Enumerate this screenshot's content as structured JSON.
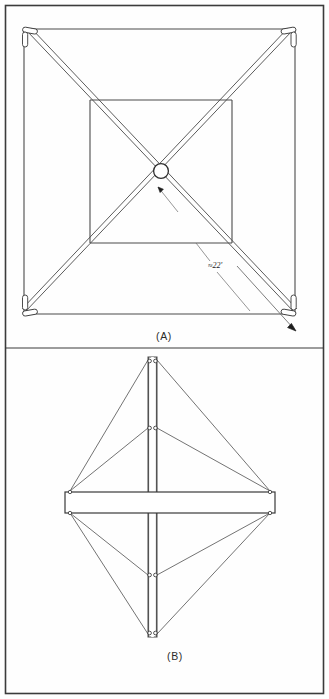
{
  "figure": {
    "border": {
      "color": "#3b3b3b",
      "x": 5,
      "y": 5,
      "width": 319,
      "height": 689
    },
    "line_color": "#4a4a4a",
    "member_color": "#3a3a3a",
    "fill_color": "#ffffff",
    "divider": {
      "y": 348,
      "color": "#3b3b3b"
    },
    "panels": [
      {
        "id": "A",
        "caption": "(A)",
        "view": "plan",
        "caption_pos": {
          "x": 164,
          "y": 338
        },
        "outer_square": {
          "x1": 22,
          "y1": 28,
          "x2": 297,
          "y2": 315
        },
        "inner_square": {
          "x1": 90,
          "y1": 100,
          "x2": 232,
          "y2": 243
        },
        "hub": {
          "cx": 161,
          "cy": 171,
          "r": 7.5
        },
        "corner_fittings": [
          {
            "cx": 26,
            "cy": 33,
            "angle": 45
          },
          {
            "cx": 293,
            "cy": 33,
            "angle": -45
          },
          {
            "cx": 26,
            "cy": 310,
            "angle": -45
          },
          {
            "cx": 293,
            "cy": 310,
            "angle": 45
          }
        ],
        "dimension": {
          "label": "≈22'",
          "label_pos": {
            "x": 213,
            "y": 267
          },
          "leader_from": {
            "x": 211,
            "y": 262
          },
          "leader_to": {
            "x": 196,
            "y": 243
          },
          "leader2_from": {
            "x": 216,
            "y": 272
          },
          "leader2_to": {
            "x": 246,
            "y": 307
          }
        },
        "arrow_head": {
          "x": 296,
          "y": 330,
          "from_x": 240,
          "from_y": 268
        },
        "inner_arrow_head": {
          "x": 156,
          "y": 186,
          "from_x": 176,
          "from_y": 210
        }
      },
      {
        "id": "B",
        "caption": "(B)",
        "view": "elevation",
        "caption_pos": {
          "x": 175,
          "y": 657
        },
        "mast": {
          "x1": 148,
          "x2": 157,
          "y_top": 357,
          "y_bottom": 637
        },
        "beam": {
          "x1": 65,
          "y1": 492,
          "x2": 275,
          "y2": 512
        },
        "nodes": [
          {
            "name": "mast-top",
            "x": 152,
            "y": 360
          },
          {
            "name": "mast-upper-mid",
            "x": 152,
            "y": 428
          },
          {
            "name": "mast-lower-mid",
            "x": 152,
            "y": 575
          },
          {
            "name": "mast-bottom",
            "x": 152,
            "y": 634
          },
          {
            "name": "beam-left-top",
            "x": 70,
            "y": 492
          },
          {
            "name": "beam-right-top",
            "x": 270,
            "y": 492
          },
          {
            "name": "beam-left-bottom",
            "x": 70,
            "y": 512
          },
          {
            "name": "beam-right-bottom",
            "x": 270,
            "y": 512
          }
        ],
        "guys": [
          {
            "x1": 148,
            "y1": 360,
            "x2": 70,
            "y2": 492
          },
          {
            "x1": 157,
            "y1": 360,
            "x2": 270,
            "y2": 492
          },
          {
            "x1": 148,
            "y1": 428,
            "x2": 70,
            "y2": 492
          },
          {
            "x1": 157,
            "y1": 428,
            "x2": 270,
            "y2": 492
          },
          {
            "x1": 148,
            "y1": 575,
            "x2": 70,
            "y2": 512
          },
          {
            "x1": 157,
            "y1": 575,
            "x2": 270,
            "y2": 512
          },
          {
            "x1": 148,
            "y1": 634,
            "x2": 70,
            "y2": 512
          },
          {
            "x1": 157,
            "y1": 634,
            "x2": 270,
            "y2": 512
          }
        ]
      }
    ]
  }
}
